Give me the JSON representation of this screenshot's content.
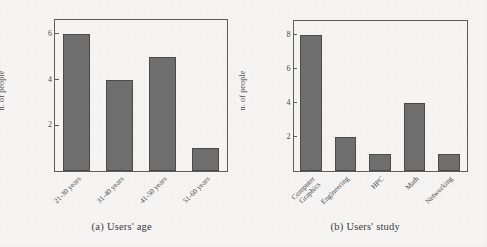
{
  "figure": {
    "background_color": "#f5f4f2",
    "bar_color": "#6e6e6e",
    "bar_edge_color": "#4a4a4a",
    "axis_color": "#5c5c5c"
  },
  "chart_data": [
    {
      "type": "bar",
      "id": "users-age",
      "title": "",
      "caption_tag": "(a)",
      "caption_text": "Users' age",
      "categories": [
        "21-30 years",
        "31-40 years",
        "41-50 years",
        "51-60 years"
      ],
      "values": [
        6,
        4,
        5,
        1
      ],
      "xlabel": "",
      "ylabel": "n. of people",
      "ylim": [
        0,
        6.6
      ],
      "yticks": [
        2,
        4,
        6
      ],
      "ytick_labels": [
        "2",
        "4",
        "6"
      ],
      "grid": false,
      "legend": null,
      "xtick_rotation_deg": -45
    },
    {
      "type": "bar",
      "id": "users-study",
      "title": "",
      "caption_tag": "(b)",
      "caption_text": "Users' study",
      "categories": [
        "Computer\nGraphics",
        "Engineering",
        "HPC",
        "Math",
        "Networking"
      ],
      "values": [
        8,
        2,
        1,
        4,
        1
      ],
      "xlabel": "",
      "ylabel": "n. of people",
      "ylim": [
        0,
        8.8
      ],
      "yticks": [
        2,
        4,
        6,
        8
      ],
      "ytick_labels": [
        "2",
        "4",
        "6",
        "8"
      ],
      "grid": false,
      "legend": null,
      "xtick_rotation_deg": -45
    }
  ]
}
